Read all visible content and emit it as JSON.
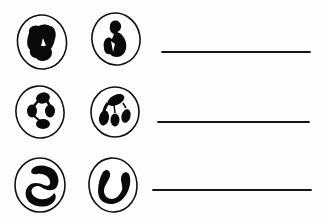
{
  "diagram": {
    "colors": {
      "ink": "#111111",
      "background": "#ffffff"
    },
    "rows": [
      {
        "cells": [
          {
            "label": "cell-1a",
            "nucleus_shape": "lobed-clump",
            "cx": 42,
            "cy": 42,
            "rx": 25,
            "ry": 27
          },
          {
            "label": "cell-1b",
            "nucleus_shape": "bent-bilobed",
            "cx": 116,
            "cy": 40,
            "rx": 24,
            "ry": 26
          }
        ],
        "answer": {
          "value": "",
          "x1": 162,
          "x2": 310,
          "y": 52
        }
      },
      {
        "cells": [
          {
            "label": "cell-2a",
            "nucleus_shape": "four-lobed",
            "cx": 40,
            "cy": 112,
            "rx": 24,
            "ry": 26
          },
          {
            "label": "cell-2b",
            "nucleus_shape": "multi-lobed",
            "cx": 115,
            "cy": 112,
            "rx": 24,
            "ry": 25
          }
        ],
        "answer": {
          "value": "",
          "x1": 158,
          "x2": 309,
          "y": 122
        }
      },
      {
        "cells": [
          {
            "label": "cell-3a",
            "nucleus_shape": "s-shaped",
            "cx": 40,
            "cy": 185,
            "rx": 25,
            "ry": 27
          },
          {
            "label": "cell-3b",
            "nucleus_shape": "u-shaped-band",
            "cx": 113,
            "cy": 185,
            "rx": 24,
            "ry": 27
          }
        ],
        "answer": {
          "value": "",
          "x1": 153,
          "x2": 311,
          "y": 190
        }
      }
    ]
  }
}
